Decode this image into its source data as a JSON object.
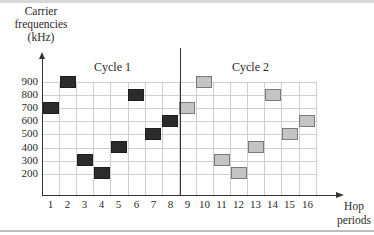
{
  "chart_data": {
    "type": "scatter",
    "title": "",
    "xlabel": "Hop periods",
    "ylabel": "Carrier frequencies (kHz)",
    "x_ticks": [
      1,
      2,
      3,
      4,
      5,
      6,
      7,
      8,
      9,
      10,
      11,
      12,
      13,
      14,
      15,
      16
    ],
    "y_ticks": [
      200,
      300,
      400,
      500,
      600,
      700,
      800,
      900
    ],
    "ylim": [
      100,
      900
    ],
    "grid": true,
    "annotations": [
      "Cycle 1",
      "Cycle 2"
    ],
    "series": [
      {
        "name": "Cycle 1",
        "color": "#2b2b2b",
        "points": [
          [
            1,
            700
          ],
          [
            2,
            900
          ],
          [
            3,
            300
          ],
          [
            4,
            200
          ],
          [
            5,
            400
          ],
          [
            6,
            800
          ],
          [
            7,
            500
          ],
          [
            8,
            600
          ]
        ]
      },
      {
        "name": "Cycle 2",
        "color": "#c4c4c4",
        "points": [
          [
            9,
            700
          ],
          [
            10,
            900
          ],
          [
            11,
            300
          ],
          [
            12,
            200
          ],
          [
            13,
            400
          ],
          [
            14,
            800
          ],
          [
            15,
            500
          ],
          [
            16,
            600
          ]
        ]
      }
    ]
  },
  "labels": {
    "ylabel_line1": "Carrier",
    "ylabel_line2": "frequencies",
    "ylabel_line3": "(kHz)",
    "xlabel_line1": "Hop",
    "xlabel_line2": "periods",
    "cycle1": "Cycle 1",
    "cycle2": "Cycle 2"
  },
  "y_tick_labels": [
    "900",
    "800",
    "700",
    "600",
    "500",
    "400",
    "300",
    "200"
  ],
  "x_tick_labels": [
    "1",
    "2",
    "3",
    "4",
    "5",
    "6",
    "7",
    "8",
    "9",
    "10",
    "11",
    "12",
    "13",
    "14",
    "15",
    "16"
  ]
}
